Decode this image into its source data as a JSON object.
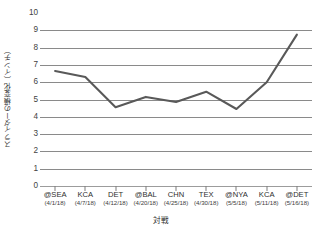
{
  "chart_data": {
    "type": "line",
    "title": "",
    "xlabel": "対戦",
    "ylabel": "スライダーの横変化（インチ）",
    "ylim": [
      0,
      10
    ],
    "ytick_step": 1,
    "grid": true,
    "legend": "none",
    "line_color": "#595959",
    "categories": [
      "@SEA",
      "KCA",
      "DET",
      "@BAL",
      "CHN",
      "TEX",
      "@NYA",
      "KCA",
      "@DET"
    ],
    "category_dates": [
      "(4/1/18)",
      "(4/7/18)",
      "(4/12/18)",
      "(4/20/18)",
      "(4/25/18)",
      "(4/30/18)",
      "(5/5/18)",
      "(5/11/18)",
      "(5/16/18)"
    ],
    "values": [
      6.65,
      6.3,
      4.55,
      5.15,
      4.85,
      5.45,
      4.45,
      6.0,
      8.75
    ],
    "ytick_labels": [
      "10",
      "9",
      "8",
      "7",
      "6",
      "5",
      "4",
      "3",
      "2",
      "1",
      "0"
    ],
    "ytick_values": [
      10,
      9,
      8,
      7,
      6,
      5,
      4,
      3,
      2,
      1,
      0
    ]
  }
}
